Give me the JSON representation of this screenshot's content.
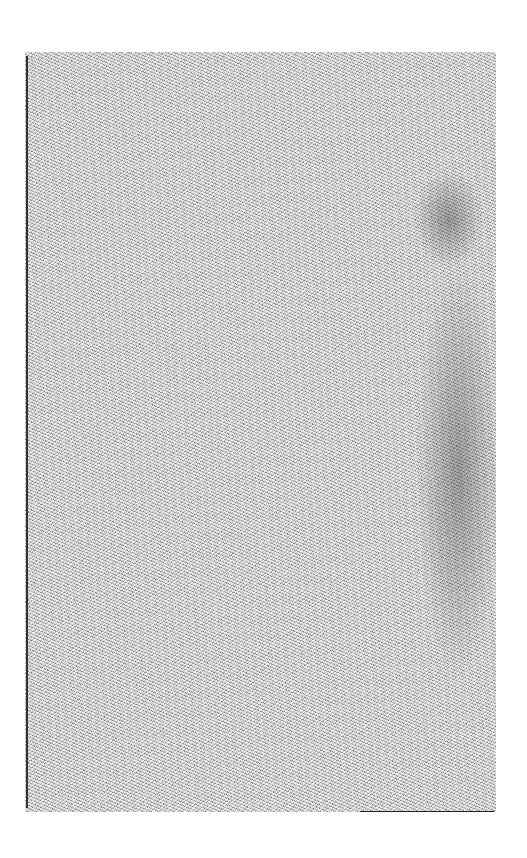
{
  "page": {
    "kind": "blank speckled page scan",
    "colors": {
      "background": "#ffffff",
      "texture_mid": "#bdbdbd",
      "texture_dark": "#333333"
    }
  }
}
